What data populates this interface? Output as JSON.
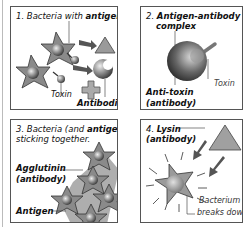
{
  "panels": [
    {
      "number": "1.",
      "title_plain": "Bacteria with",
      "title_bold": "antigens",
      "labels": {
        "toxin": "Toxin",
        "antibodies": "Antibodies"
      }
    },
    {
      "number": "2.",
      "title_bold_line1": "Antigen-antibody",
      "title_bold_line2": "complex",
      "labels": {
        "toxin": "Toxin",
        "antitoxin": "Anti-toxin",
        "antitoxin_sub": "(antibody)"
      }
    },
    {
      "number": "3.",
      "title_plain_a": "Bacteria (and",
      "title_bold": "antigens",
      "title_plain_b": ")",
      "title_line2": "sticking together.",
      "labels": {
        "agglutinin": "Agglutinin",
        "agglutinin_sub": "(antibody)",
        "antigen": "Antigen"
      }
    },
    {
      "number": "4.",
      "title_bold_line1": "Lysin",
      "title_line2": "(antibody)",
      "labels": {
        "bacterium_line1": "Bacterium",
        "bacterium_line2": "breaks down"
      }
    }
  ],
  "colors": {
    "panel_border": "#555555",
    "shape_fill": "#9a9a9a",
    "arrow_fill": "#555555",
    "sphere_dark": "#4a4a4a"
  }
}
